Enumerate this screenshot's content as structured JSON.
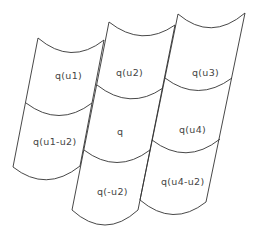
{
  "diagram": {
    "stroke_color": "#333333",
    "label_color": "#444444",
    "cells": [
      {
        "id": "q_u1",
        "label": "q(u1)",
        "x": 55,
        "y": 79
      },
      {
        "id": "q_u2",
        "label": "q(u2)",
        "x": 116,
        "y": 76
      },
      {
        "id": "q_u3",
        "label": "q(u3)",
        "x": 192,
        "y": 76
      },
      {
        "id": "q_u1_minus_u2",
        "label": "q(u1-u2)",
        "x": 33,
        "y": 145
      },
      {
        "id": "q",
        "label": "q",
        "x": 117,
        "y": 135
      },
      {
        "id": "q_u4",
        "label": "q(u4)",
        "x": 179,
        "y": 133
      },
      {
        "id": "q_minus_u2",
        "label": "q(-u2)",
        "x": 97,
        "y": 195
      },
      {
        "id": "q_u4_minus_u2",
        "label": "q(u4-u2)",
        "x": 161,
        "y": 185
      }
    ]
  }
}
